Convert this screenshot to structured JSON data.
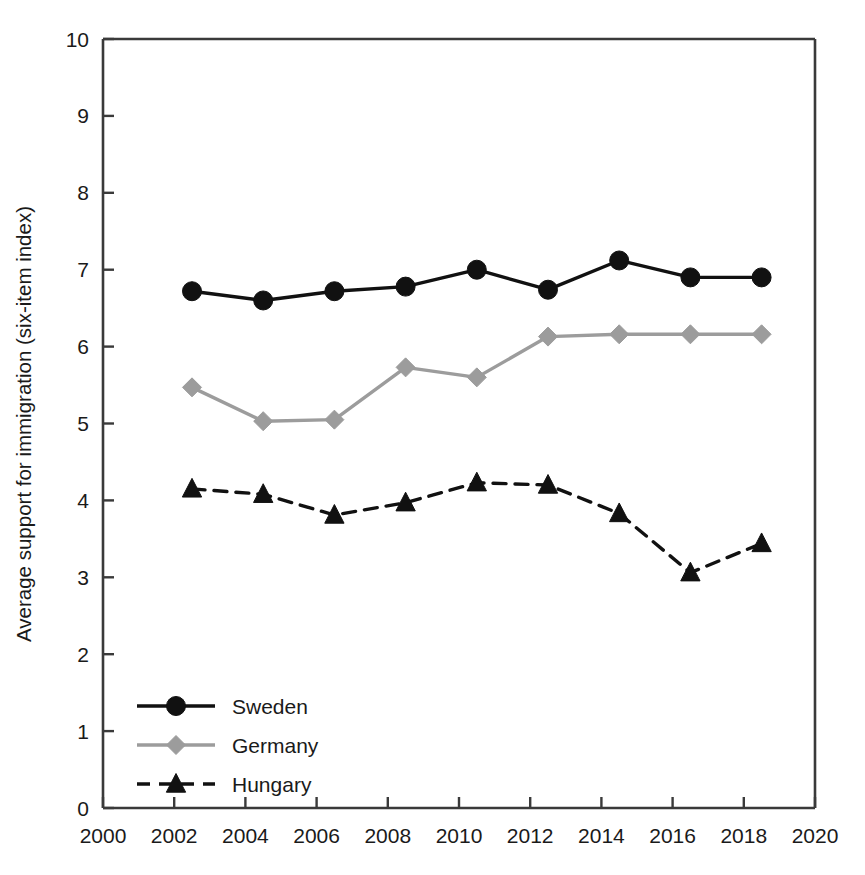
{
  "chart_data": {
    "type": "line",
    "title": "",
    "subtitle": "",
    "xlabel": "",
    "ylabel": "Average support for immigration (six-item index)",
    "xlim": [
      2000,
      2020
    ],
    "ylim": [
      0,
      10
    ],
    "xticks": [
      2000,
      2002,
      2004,
      2006,
      2008,
      2010,
      2012,
      2014,
      2016,
      2018,
      2020
    ],
    "yticks": [
      0,
      1,
      2,
      3,
      4,
      5,
      6,
      7,
      8,
      9,
      10
    ],
    "xtick_labels": [
      "2000",
      "2002",
      "2004",
      "2006",
      "2008",
      "2010",
      "2012",
      "2014",
      "2016",
      "2018",
      "2020"
    ],
    "ytick_labels": [
      "0",
      "1",
      "2",
      "3",
      "4",
      "5",
      "6",
      "7",
      "8",
      "9",
      "10"
    ],
    "grid": false,
    "legend_position": "lower-left",
    "x": [
      2002.5,
      2004.5,
      2006.5,
      2008.5,
      2010.5,
      2012.5,
      2014.5,
      2016.5,
      2018.5
    ],
    "series": [
      {
        "name": "Sweden",
        "color": "#111111",
        "line_style": "solid",
        "marker": "circle",
        "values": [
          6.72,
          6.6,
          6.72,
          6.78,
          7.0,
          6.74,
          7.12,
          6.9,
          6.9
        ]
      },
      {
        "name": "Germany",
        "color": "#9c9c9c",
        "line_style": "solid",
        "marker": "diamond",
        "values": [
          5.47,
          5.03,
          5.05,
          5.73,
          5.6,
          6.13,
          6.16,
          6.16,
          6.16
        ]
      },
      {
        "name": "Hungary",
        "color": "#111111",
        "line_style": "dashed",
        "marker": "triangle",
        "values": [
          4.15,
          4.08,
          3.81,
          3.97,
          4.23,
          4.2,
          3.83,
          3.06,
          3.44
        ]
      }
    ]
  },
  "legend": {
    "items": [
      {
        "label": "Sweden"
      },
      {
        "label": "Germany"
      },
      {
        "label": "Hungary"
      }
    ]
  },
  "axes": {
    "y_axis_title": "Average support for immigration (six-item index)"
  },
  "colors": {
    "sweden": "#111111",
    "germany": "#9c9c9c",
    "hungary": "#111111",
    "axis": "#3a3a3a",
    "background": "#ffffff"
  }
}
